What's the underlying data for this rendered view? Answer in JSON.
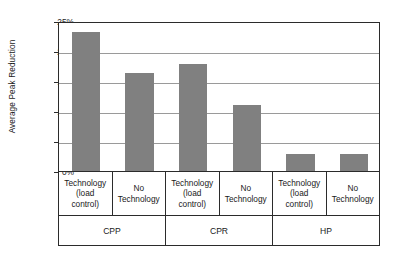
{
  "chart_data": {
    "type": "bar",
    "title": "",
    "subtitle": "",
    "xlabel": "",
    "ylabel": "Average Peak Reduction",
    "ylim": [
      0,
      25
    ],
    "ytick_labels": [
      "0%",
      "5%",
      "10%",
      "15%",
      "20%",
      "25%"
    ],
    "ytick_values": [
      0,
      5,
      10,
      15,
      20,
      25
    ],
    "grid": "horizontal",
    "legend": "none",
    "bar_color": "#808080",
    "axis_color": "#2b2b2b",
    "gridline_color": "#9a9a9a",
    "categories": [
      "Technology (load control)",
      "No Technology",
      "Technology (load control)",
      "No Technology",
      "Technology (load control)",
      "No Technology"
    ],
    "category_lines": [
      [
        "Technology",
        "(load",
        "control)"
      ],
      [
        "No",
        "Technology"
      ],
      [
        "Technology",
        "(load",
        "control)"
      ],
      [
        "No",
        "Technology"
      ],
      [
        "Technology",
        "(load",
        "control)"
      ],
      [
        "No",
        "Technology"
      ]
    ],
    "values": [
      23.1,
      16.3,
      17.8,
      11.0,
      2.8,
      2.8
    ],
    "groups": [
      "CPP",
      "CPR",
      "HP"
    ],
    "group_spans": [
      2,
      2,
      2
    ]
  }
}
